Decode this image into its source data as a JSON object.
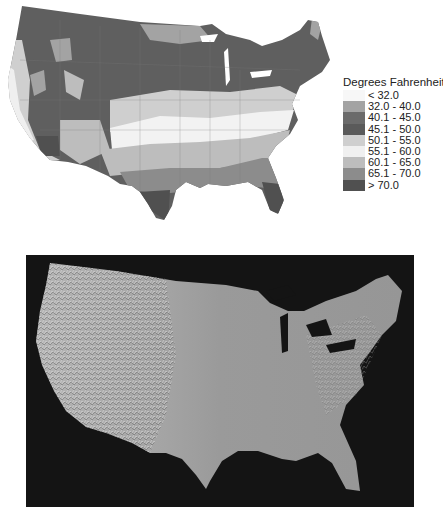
{
  "top_map": {
    "subject": "Contiguous United States temperature map",
    "legend": {
      "title": "Degrees Fahrenheit",
      "items": [
        {
          "label": "< 32.0",
          "color": "#f7f7f7"
        },
        {
          "label": "32.0 - 40.0",
          "color": "#a3a3a3"
        },
        {
          "label": "40.1 - 45.0",
          "color": "#6b6b6b"
        },
        {
          "label": "45.1 - 50.0",
          "color": "#5a5a5a"
        },
        {
          "label": "50.1 - 55.0",
          "color": "#cfcfcf"
        },
        {
          "label": "55.1 - 60.0",
          "color": "#f0f0f0"
        },
        {
          "label": "60.1 - 65.0",
          "color": "#bdbdbd"
        },
        {
          "label": "65.1 - 70.0",
          "color": "#8c8c8c"
        },
        {
          "label": "> 70.0",
          "color": "#505050"
        }
      ]
    }
  },
  "bottom_map": {
    "subject": "Shaded relief map of the contiguous United States",
    "background_color": "#141414",
    "land_color": "#9a9a9a"
  }
}
